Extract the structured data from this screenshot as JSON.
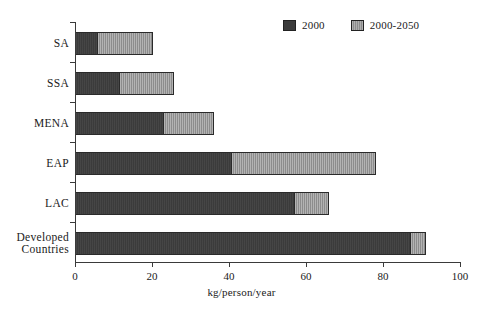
{
  "chart_data": {
    "type": "bar",
    "orientation": "horizontal",
    "stacked": true,
    "title": "",
    "xlabel": "kg/person/year",
    "ylabel": "",
    "xlim": [
      0,
      100
    ],
    "xticks": [
      0,
      20,
      40,
      60,
      80,
      100
    ],
    "xtick_labels": [
      "0",
      "20",
      "40",
      "60",
      "80",
      "100"
    ],
    "grid": false,
    "legend_position": "top-right",
    "categories": [
      "SA",
      "SSA",
      "MENA",
      "EAP",
      "LAC",
      "Developed\nCountries"
    ],
    "series": [
      {
        "name": "2000",
        "color": "#3b3b3b",
        "values": [
          5.7,
          11.4,
          22.8,
          40.5,
          57.0,
          87.0
        ]
      },
      {
        "name": "2000-2050",
        "color": "#8c8c8c",
        "values": [
          14.3,
          14.1,
          13.0,
          37.5,
          8.7,
          4.0
        ]
      }
    ],
    "totals": [
      20.0,
      25.5,
      35.8,
      78.0,
      65.7,
      91.0
    ]
  },
  "legend": {
    "entries": [
      {
        "label": "2000",
        "swatch": "dark-swatch-icon"
      },
      {
        "label": "2000-2050",
        "swatch": "light-swatch-icon"
      }
    ]
  },
  "axis": {
    "x_title": "kg/person/year"
  }
}
